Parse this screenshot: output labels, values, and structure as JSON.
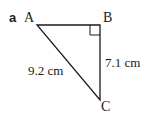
{
  "part_label": "a",
  "vertices": {
    "A": {
      "label": "A",
      "x": 37,
      "y": 25
    },
    "B": {
      "label": "B",
      "x": 100,
      "y": 25
    },
    "C": {
      "label": "C",
      "x": 100,
      "y": 100
    }
  },
  "sides": {
    "AC": {
      "label": "9.2 cm"
    },
    "BC": {
      "label": "7.1 cm"
    }
  },
  "right_angle_at": "B",
  "colors": {
    "stroke": "#1a1a1a"
  }
}
